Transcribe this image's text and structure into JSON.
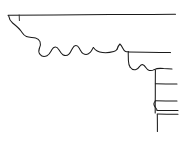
{
  "document": {
    "title": "Cornice Moulding Profile",
    "kind": "line-drawing",
    "background_color": "#ffffff",
    "stroke_color": "#1a1a1a",
    "canvas": {
      "width": 185,
      "height": 145
    }
  },
  "drawing": {
    "description": "Freehand ink line drawing of an architectural cornice / entablature profile in section, showing a top fascia band, an ogee-and-bead scalloped course, a lower cavetto with bead, and a stepped right-hand block with three horizontal joint lines.",
    "strokes": [
      {
        "name": "top-fascia-line",
        "role": "upper horizontal soffit edge",
        "path": "M 8 15.2 L 54 14.9 L 110 14.6 L 152 14.4 L 175.5 14.2"
      },
      {
        "name": "top-left-tick",
        "role": "short vertical return at left end of fascia",
        "path": "M 19.2 15.0 L 19.4 20.6"
      },
      {
        "name": "upper-ogee-descent",
        "role": "S-curve falling from fascia to the scalloped course",
        "path": "M 8.6 15.6 C 9.2 19.2 10.6 21.4 12.6 23.0 C 15.6 25.4 18.6 27.8 21.0 31.0 C 22.6 33.2 23.8 35.6 26.4 36.6 C 29.2 37.7 32.6 37.3 35.6 38.0 C 37.6 38.5 39.2 39.7 40.0 41.6 C 40.9 43.8 40.3 46.2 39.4 48.2"
      },
      {
        "name": "bead-scallop-course",
        "role": "row of four bead scallops along the corona underside",
        "path": "M 39.4 48.2 C 38.6 50.2 38.6 52.6 40.0 54.3 C 41.6 56.3 44.6 56.8 47.0 55.7 C 49.4 54.6 50.6 52.0 51.8 49.8 C 52.6 48.4 53.6 47.2 55.2 47.1 C 56.9 47.0 58.0 48.3 58.9 49.7 C 60.0 51.5 61.0 53.6 62.9 54.7 C 64.9 55.9 67.6 55.4 69.2 53.8 C 70.7 52.3 71.4 50.2 72.4 48.4 C 73.2 47.0 74.2 45.7 75.8 45.6 C 77.5 45.5 78.5 46.9 79.3 48.3 C 80.4 50.2 81.3 52.4 83.2 53.6 C 85.3 54.9 88.2 54.4 89.9 52.7 C 91.4 51.2 92.2 49.2 93.4 47.5"
      },
      {
        "name": "corona-underside-sweep",
        "role": "long shallow sweep from the scallops toward the right bead",
        "path": "M 93.4 47.5 C 95.6 50.6 99.0 52.2 102.6 52.6 C 106.4 53.0 110.2 52.6 113.8 51.6 C 115.4 51.2 116.4 50.5 117.2 49.0"
      },
      {
        "name": "right-bead-peak",
        "role": "raised bead / fillet peak terminating the scalloped course",
        "path": "M 117.2 49.0 C 117.8 47.0 118.6 45.2 119.9 44.0 C 121.2 45.0 122.0 46.6 122.8 48.3 C 123.5 49.8 124.2 51.0 125.6 51.5 C 126.6 51.9 127.7 51.8 128.6 51.8"
      },
      {
        "name": "mid-fascia-line",
        "role": "second horizontal band edge running to the right margin",
        "path": "M 128.6 51.9 L 146 52.2 L 160 52.5 L 170.5 52.6"
      },
      {
        "name": "mid-fascia-left-drop",
        "role": "vertical face of the mid band dropping to the cavetto",
        "path": "M 128.2 52.0 L 128.4 60.4 C 128.5 63.0 128.9 65.4 130.2 67.2"
      },
      {
        "name": "lower-cavetto-and-bead",
        "role": "cavetto hollow with a single bead, stepping down to the right",
        "path": "M 130.2 67.2 C 131.6 69.2 133.8 70.2 136.0 69.6 C 137.8 69.1 138.8 67.6 139.8 66.2 C 140.6 65.1 141.6 64.4 142.9 64.7 C 144.2 65.0 144.9 66.2 145.6 67.3 C 146.5 68.7 147.6 70.0 149.3 70.4 C 151.0 70.8 152.8 70.4 154.2 69.6"
      },
      {
        "name": "lower-step-horizontal",
        "role": "short horizontal under the bead leading to the stepped block",
        "path": "M 154.2 69.6 C 157.2 68.1 160.4 68.2 163.6 68.6 L 172 69.0"
      },
      {
        "name": "block-vertical-edge",
        "role": "tall vertical left face of the stepped right-hand block",
        "path": "M 155.4 69.9 L 155.3 84.0 L 155.3 96.0 L 155.2 104.0 L 155.2 113.0"
      },
      {
        "name": "block-joint-line-1",
        "role": "first horizontal joint of the block course",
        "path": "M 155.4 83.8 L 166 83.9 L 177 84.0"
      },
      {
        "name": "block-joint-line-2",
        "role": "second horizontal joint of the block course",
        "path": "M 155.3 100.8 L 166 100.9 L 177 101.0"
      },
      {
        "name": "block-joint-line-3",
        "role": "third horizontal joint of the block course",
        "path": "M 157.0 110.4 L 167 110.5 L 178 110.6"
      },
      {
        "name": "block-joint-line-4",
        "role": "fourth horizontal joint closely paired with the third",
        "path": "M 157.2 114.1 L 167 114.2 L 178 114.3"
      },
      {
        "name": "block-bead-notch",
        "role": "small bead notch between the second and third joints",
        "path": "M 155.3 101.0 C 153.9 102.4 153.6 104.6 154.6 106.3 C 155.4 107.7 156.6 108.6 157.1 110.2"
      },
      {
        "name": "block-lower-vertical",
        "role": "vertical continuation of the block below the lowest joint",
        "path": "M 157.3 114.4 L 157.4 124.0 L 157.4 131.5"
      }
    ]
  }
}
